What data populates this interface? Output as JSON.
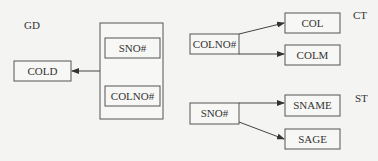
{
  "diagram": {
    "groups": [
      {
        "id": "GD",
        "label": "GD"
      },
      {
        "id": "CT",
        "label": "CT"
      },
      {
        "id": "ST",
        "label": "ST"
      }
    ],
    "nodes": {
      "gd_cold": "COLD",
      "gd_sno": "SNO#",
      "gd_colno": "COLNO#",
      "ct_colno": "COLNO#",
      "ct_col": "COL",
      "ct_colm": "COLM",
      "st_sno": "SNO#",
      "st_sname": "SNAME",
      "st_sage": "SAGE"
    },
    "edges": [
      {
        "from": "gd_composite_key",
        "to": "gd_cold"
      },
      {
        "from": "ct_colno",
        "to": "ct_col"
      },
      {
        "from": "ct_colno",
        "to": "ct_colm"
      },
      {
        "from": "st_sno",
        "to": "st_sname"
      },
      {
        "from": "st_sno",
        "to": "st_sage"
      }
    ]
  }
}
